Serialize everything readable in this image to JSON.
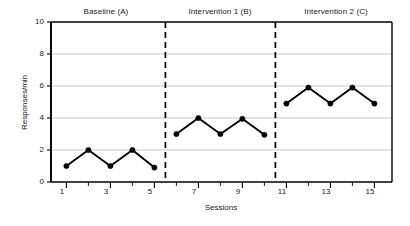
{
  "chart_data": {
    "type": "line",
    "title": "",
    "subtitle": "",
    "xlabel": "Sessions",
    "ylabel": "Responses/min",
    "xlim": [
      0.3,
      15.8
    ],
    "ylim": [
      0,
      10
    ],
    "grid": true,
    "grid_axis": "y",
    "legend": "none",
    "x": [
      1,
      2,
      3,
      4,
      5,
      6,
      7,
      8,
      9,
      10,
      11,
      12,
      13,
      14,
      15
    ],
    "yticks": [
      "0",
      "2",
      "4",
      "6",
      "8",
      "10"
    ],
    "ytick_values": [
      0,
      2,
      4,
      6,
      8,
      10
    ],
    "xticks": [
      "1",
      "3",
      "5",
      "7",
      "9",
      "11",
      "13",
      "15"
    ],
    "xtick_values": [
      1,
      3,
      5,
      7,
      9,
      11,
      13,
      15
    ],
    "xminor_values": [
      2,
      4,
      6,
      8,
      10,
      12,
      14
    ],
    "marker": "filled-circle",
    "marker_color": "#000000",
    "line_color": "#000000",
    "grid_color": "#b9b9b9",
    "axis_color": "#000000",
    "phase_line_color": "#000000",
    "phase_line_style": "dashed",
    "series": [
      {
        "name": "Baseline (A)",
        "phase": "A",
        "x": [
          1,
          2,
          3,
          4,
          5
        ],
        "values": [
          1.0,
          2.0,
          1.0,
          2.0,
          0.9
        ]
      },
      {
        "name": "Intervention 1 (B)",
        "phase": "B",
        "x": [
          6,
          7,
          8,
          9,
          10
        ],
        "values": [
          3.0,
          4.0,
          3.0,
          3.95,
          2.95
        ]
      },
      {
        "name": "Intervention 2 (C)",
        "phase": "C",
        "x": [
          11,
          12,
          13,
          14,
          15
        ],
        "values": [
          4.9,
          5.9,
          4.9,
          5.9,
          4.9
        ]
      }
    ],
    "phase_dividers": [
      5.5,
      10.5
    ],
    "annotations": [
      {
        "text": "Baseline (A)",
        "x_center": 3.0,
        "position": "above-plot"
      },
      {
        "text": "Intervention 1 (B)",
        "x_center": 8.0,
        "position": "above-plot"
      },
      {
        "text": "Intervention 2 (C)",
        "x_center": 13.0,
        "position": "above-plot"
      }
    ]
  },
  "labels": {
    "phase_a": "Baseline (A)",
    "phase_b": "Intervention 1 (B)",
    "phase_c": "Intervention 2 (C)",
    "y_axis_title": "Responses/min",
    "x_axis_title": "Sessions",
    "y_0": "0",
    "y_2": "2",
    "y_4": "4",
    "y_6": "6",
    "y_8": "8",
    "y_10": "10",
    "x_1": "1",
    "x_3": "3",
    "x_5": "5",
    "x_7": "7",
    "x_9": "9",
    "x_11": "11",
    "x_13": "13",
    "x_15": "15"
  }
}
